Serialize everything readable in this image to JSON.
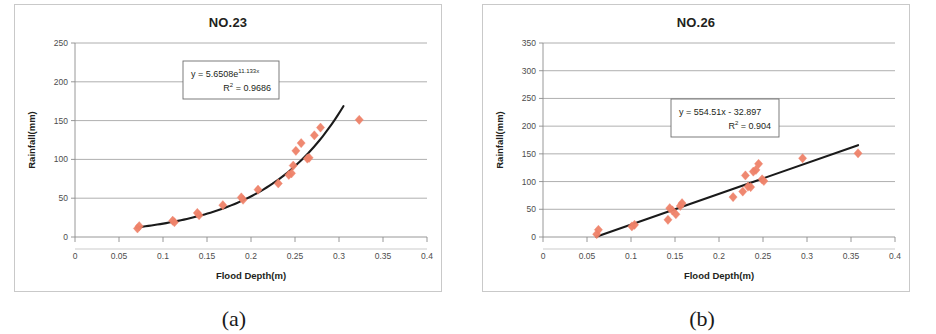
{
  "figure": {
    "panels": [
      {
        "caption": "(a)",
        "title": "NO.23",
        "equation": "y = 5.6508e",
        "equation_exponent": "11.133x",
        "r2_label": "R",
        "r2_sup": "2",
        "r2_value": " = 0.9686",
        "chart_data": {
          "type": "scatter",
          "title": "NO.23",
          "xlabel": "Flood Depth(m)",
          "ylabel": "Rainfall(mm)",
          "xlim": [
            0,
            0.4
          ],
          "ylim": [
            0,
            250
          ],
          "xticks": [
            "0",
            "0.05",
            "0.1",
            "0.15",
            "0.2",
            "0.25",
            "0.3",
            "0.35",
            "0.4"
          ],
          "xtick_values": [
            0,
            0.05,
            0.1,
            0.15,
            0.2,
            0.25,
            0.3,
            0.35,
            0.4
          ],
          "yticks": [
            "0",
            "50",
            "100",
            "150",
            "200",
            "250"
          ],
          "ytick_values": [
            0,
            50,
            100,
            150,
            200,
            250
          ],
          "grid": "horizontal",
          "legend": "none",
          "marker": "diamond",
          "marker_color": "#ef8269",
          "trend_color": "#1a1a1a",
          "trend_type": "exponential",
          "trend_a": 5.6508,
          "trend_b": 11.133,
          "trend_r2": 0.9686,
          "trend_x_range": [
            0.07,
            0.305
          ],
          "annotation": "y = 5.6508e^11.133x ; R² = 0.9686",
          "points": [
            {
              "x": 0.071,
              "y": 11
            },
            {
              "x": 0.073,
              "y": 14
            },
            {
              "x": 0.111,
              "y": 21
            },
            {
              "x": 0.113,
              "y": 19
            },
            {
              "x": 0.139,
              "y": 31
            },
            {
              "x": 0.141,
              "y": 28
            },
            {
              "x": 0.168,
              "y": 41
            },
            {
              "x": 0.189,
              "y": 51
            },
            {
              "x": 0.191,
              "y": 48
            },
            {
              "x": 0.208,
              "y": 61
            },
            {
              "x": 0.231,
              "y": 69
            },
            {
              "x": 0.243,
              "y": 80
            },
            {
              "x": 0.246,
              "y": 82
            },
            {
              "x": 0.248,
              "y": 92
            },
            {
              "x": 0.251,
              "y": 111
            },
            {
              "x": 0.257,
              "y": 121
            },
            {
              "x": 0.264,
              "y": 101
            },
            {
              "x": 0.266,
              "y": 102
            },
            {
              "x": 0.272,
              "y": 131
            },
            {
              "x": 0.279,
              "y": 141
            },
            {
              "x": 0.323,
              "y": 151
            }
          ]
        }
      },
      {
        "caption": "(b)",
        "title": "NO.26",
        "equation": "y = 554.51x - 32.897",
        "equation_exponent": "",
        "r2_label": "R",
        "r2_sup": "2",
        "r2_value": " = 0.904",
        "chart_data": {
          "type": "scatter",
          "title": "NO.26",
          "xlabel": "Flood Depth(m)",
          "ylabel": "Rainfall(mm)",
          "xlim": [
            0,
            0.4
          ],
          "ylim": [
            0,
            350
          ],
          "xticks": [
            "0",
            "0.05",
            "0.1",
            "0.15",
            "0.2",
            "0.25",
            "0.3",
            "0.35",
            "0.4"
          ],
          "xtick_values": [
            0,
            0.05,
            0.1,
            0.15,
            0.2,
            0.25,
            0.3,
            0.35,
            0.4
          ],
          "yticks": [
            "0",
            "50",
            "100",
            "150",
            "200",
            "250",
            "300",
            "350"
          ],
          "ytick_values": [
            0,
            50,
            100,
            150,
            200,
            250,
            300,
            350
          ],
          "grid": "horizontal",
          "legend": "none",
          "marker": "diamond",
          "marker_color": "#ef8269",
          "trend_color": "#1a1a1a",
          "trend_type": "linear",
          "trend_slope": 554.51,
          "trend_intercept": -32.897,
          "trend_r2": 0.904,
          "trend_x_range": [
            0.0605,
            0.358
          ],
          "annotation": "y = 554.51x - 32.897 ; R² = 0.904",
          "points": [
            {
              "x": 0.061,
              "y": 5
            },
            {
              "x": 0.063,
              "y": 13
            },
            {
              "x": 0.101,
              "y": 19
            },
            {
              "x": 0.104,
              "y": 22
            },
            {
              "x": 0.142,
              "y": 31
            },
            {
              "x": 0.144,
              "y": 52
            },
            {
              "x": 0.147,
              "y": 48
            },
            {
              "x": 0.151,
              "y": 41
            },
            {
              "x": 0.156,
              "y": 56
            },
            {
              "x": 0.158,
              "y": 61
            },
            {
              "x": 0.216,
              "y": 72
            },
            {
              "x": 0.227,
              "y": 82
            },
            {
              "x": 0.23,
              "y": 111
            },
            {
              "x": 0.233,
              "y": 91
            },
            {
              "x": 0.236,
              "y": 90
            },
            {
              "x": 0.239,
              "y": 118
            },
            {
              "x": 0.242,
              "y": 121
            },
            {
              "x": 0.245,
              "y": 132
            },
            {
              "x": 0.249,
              "y": 104
            },
            {
              "x": 0.251,
              "y": 101
            },
            {
              "x": 0.295,
              "y": 142
            },
            {
              "x": 0.358,
              "y": 151
            }
          ]
        }
      }
    ]
  }
}
